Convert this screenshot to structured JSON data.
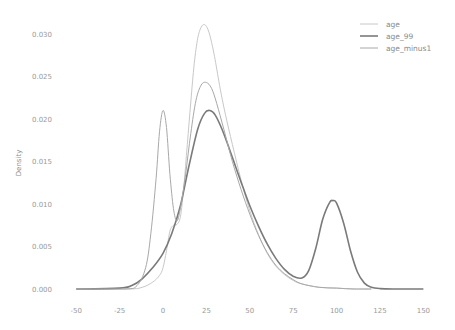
{
  "chart_data": {
    "type": "line",
    "title": "",
    "xlabel": "",
    "ylabel": "Density",
    "xlim": [
      -50,
      150
    ],
    "ylim": [
      0,
      0.031
    ],
    "grid": false,
    "legend_position": "upper right",
    "x_ticks": [
      "-50",
      "-25",
      "0",
      "25",
      "50",
      "75",
      "100",
      "125",
      "150"
    ],
    "x_tick_values": [
      -50,
      -25,
      0,
      25,
      50,
      75,
      100,
      125,
      150
    ],
    "y_ticks": [
      "0.000",
      "0.005",
      "0.010",
      "0.015",
      "0.020",
      "0.025",
      "0.030"
    ],
    "y_tick_values": [
      0,
      0.005,
      0.01,
      0.015,
      0.02,
      0.025,
      0.03
    ],
    "series": [
      {
        "name": "age",
        "color": "#c8c8c8",
        "width": 1.0,
        "x": [
          -50,
          -20,
          -12,
          -6,
          -2,
          0,
          2,
          4,
          6,
          8,
          10,
          12,
          14,
          16,
          18,
          20,
          22,
          24,
          26,
          28,
          30,
          33,
          36,
          40,
          45,
          50,
          55,
          60,
          65,
          70,
          75,
          80,
          90,
          100,
          110,
          120
        ],
        "y": [
          0,
          0,
          0.0002,
          0.0008,
          0.0016,
          0.0025,
          0.0045,
          0.0068,
          0.0075,
          0.0076,
          0.0085,
          0.012,
          0.017,
          0.022,
          0.0265,
          0.0295,
          0.0308,
          0.0311,
          0.0305,
          0.029,
          0.027,
          0.0235,
          0.0205,
          0.017,
          0.0128,
          0.0092,
          0.0064,
          0.0042,
          0.0027,
          0.0017,
          0.001,
          0.0006,
          0.0002,
          0.0001,
          0,
          0
        ]
      },
      {
        "name": "age_99",
        "color": "#7a7a7a",
        "width": 1.6,
        "x": [
          -50,
          -25,
          -18,
          -12,
          -6,
          0,
          5,
          10,
          15,
          20,
          24,
          27,
          30,
          34,
          38,
          42,
          46,
          50,
          55,
          60,
          65,
          70,
          75,
          80,
          84,
          88,
          92,
          96,
          98,
          100,
          104,
          108,
          112,
          116,
          120,
          125,
          135,
          150
        ],
        "y": [
          0,
          0.0001,
          0.0004,
          0.0012,
          0.0025,
          0.0042,
          0.0065,
          0.0098,
          0.0145,
          0.0188,
          0.0207,
          0.021,
          0.0205,
          0.0188,
          0.0166,
          0.0143,
          0.012,
          0.0098,
          0.0074,
          0.0053,
          0.0036,
          0.0023,
          0.0015,
          0.0013,
          0.0022,
          0.0048,
          0.0082,
          0.0102,
          0.0104,
          0.0101,
          0.0078,
          0.0045,
          0.002,
          0.0007,
          0.0002,
          5e-05,
          0,
          0
        ]
      },
      {
        "name": "age_minus1",
        "color": "#a8a8a8",
        "width": 1.0,
        "x": [
          -50,
          -22,
          -15,
          -10,
          -7,
          -4,
          -2,
          0,
          2,
          4,
          6,
          8,
          10,
          13,
          16,
          19,
          22,
          25,
          28,
          31,
          35,
          40,
          45,
          50,
          55,
          60,
          65,
          70,
          75,
          80,
          90,
          100,
          110,
          120
        ],
        "y": [
          0,
          0,
          0.0004,
          0.0025,
          0.0065,
          0.013,
          0.0185,
          0.021,
          0.019,
          0.0135,
          0.0095,
          0.008,
          0.0095,
          0.0135,
          0.0183,
          0.0222,
          0.024,
          0.0243,
          0.0236,
          0.0218,
          0.0188,
          0.015,
          0.0117,
          0.0088,
          0.0063,
          0.0043,
          0.0028,
          0.0018,
          0.0011,
          0.0006,
          0.0002,
          0.0001,
          0,
          0
        ]
      }
    ]
  },
  "legend": {
    "items": [
      {
        "label": "age",
        "color": "#c8c8c8"
      },
      {
        "label": "age_99",
        "color": "#7a7a7a"
      },
      {
        "label": "age_minus1",
        "color": "#a8a8a8"
      }
    ]
  }
}
